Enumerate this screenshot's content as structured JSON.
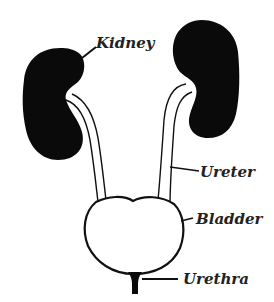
{
  "diagram": {
    "colors": {
      "organ_fill": "#0a0a0a",
      "outline": "#111111",
      "label_text": "#222222",
      "background": "#ffffff"
    },
    "labels": {
      "kidney": "Kidney",
      "ureter": "Ureter",
      "bladder": "Bladder",
      "urethra": "Urethra"
    }
  }
}
